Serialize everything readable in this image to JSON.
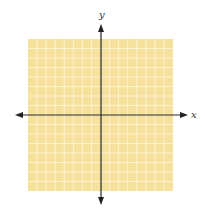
{
  "diagram": {
    "type": "coordinate-plane",
    "grid": {
      "columns": 16,
      "rows": 16,
      "fill_color": "#f6e19c",
      "line_color": "#fdf2cf",
      "left": 28,
      "top": 39,
      "right": 173,
      "bottom": 191
    },
    "axes": {
      "color": "#222222",
      "origin": {
        "x": 101,
        "y": 115
      },
      "x_axis": {
        "label": "x",
        "from": 15,
        "to": 188
      },
      "y_axis": {
        "label": "y",
        "from": 205,
        "to": 24
      }
    }
  }
}
